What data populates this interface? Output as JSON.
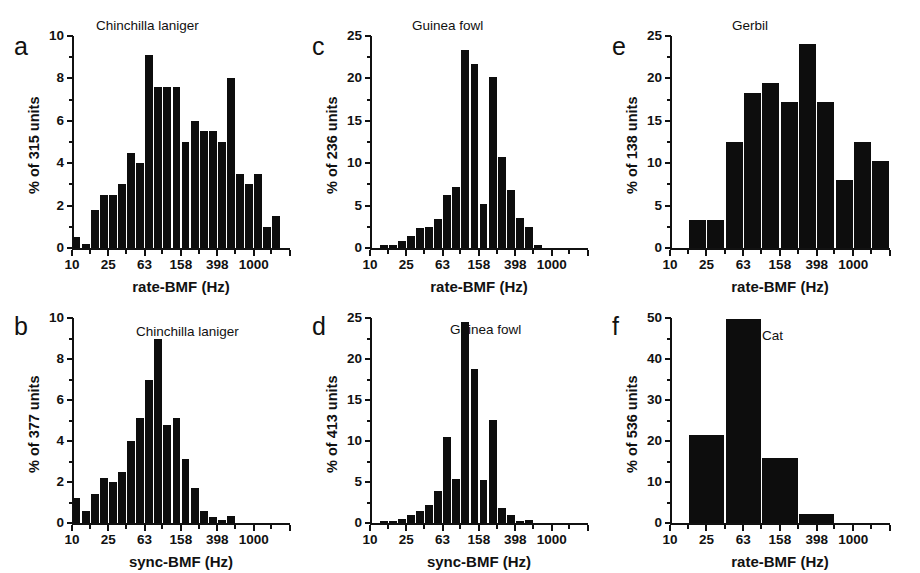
{
  "figure": {
    "background": "#ffffff",
    "bar_color": "#0d0d0d",
    "axis_color": "#111111"
  },
  "chart_data": [
    {
      "panel": "a",
      "type": "bar",
      "title": "Chinchilla laniger",
      "xlabel": "rate-BMF (Hz)",
      "ylabel": "% of 315 units",
      "n_units": 315,
      "ylim": [
        0,
        10
      ],
      "yticks": [
        0,
        2,
        4,
        6,
        8,
        10
      ],
      "ytick_labels": [
        "0",
        "2",
        "4",
        "6",
        "8",
        "10"
      ],
      "xscale": "log",
      "xlim": [
        10,
        2512
      ],
      "xticks": [
        10,
        25,
        63,
        158,
        398,
        1000
      ],
      "xtick_labels": [
        "10",
        "25",
        "63",
        "158",
        "398",
        "1000"
      ],
      "grid": false,
      "bin_decades": 0.1,
      "bin_starts": [
        10.0,
        12.59,
        15.85,
        19.95,
        25.12,
        31.62,
        39.81,
        50.12,
        63.1,
        79.43,
        100.0,
        125.9,
        158.5,
        199.5,
        251.2,
        316.2,
        398.1,
        501.2,
        631.0,
        794.3,
        1000.0,
        1259.0,
        1585.0,
        1995.0
      ],
      "values": [
        0.5,
        0.2,
        1.8,
        2.5,
        2.5,
        3.0,
        4.5,
        4.0,
        9.1,
        7.6,
        7.6,
        7.6,
        5.0,
        6.0,
        5.5,
        5.5,
        5.0,
        8.0,
        3.5,
        3.0,
        3.5,
        1.0,
        1.5,
        0.0
      ]
    },
    {
      "panel": "b",
      "type": "bar",
      "title": "Chinchilla laniger",
      "xlabel": "sync-BMF (Hz)",
      "ylabel": "% of 377 units",
      "n_units": 377,
      "ylim": [
        0,
        10
      ],
      "yticks": [
        0,
        2,
        4,
        6,
        8,
        10
      ],
      "ytick_labels": [
        "0",
        "2",
        "4",
        "6",
        "8",
        "10"
      ],
      "xscale": "log",
      "xlim": [
        10,
        2512
      ],
      "xticks": [
        10,
        25,
        63,
        158,
        398,
        1000
      ],
      "xtick_labels": [
        "10",
        "25",
        "63",
        "158",
        "398",
        "1000"
      ],
      "grid": false,
      "bin_decades": 0.1,
      "bin_starts": [
        10.0,
        12.59,
        15.85,
        19.95,
        25.12,
        31.62,
        39.81,
        50.12,
        63.1,
        79.43,
        100.0,
        125.9,
        158.5,
        199.5,
        251.2,
        316.2,
        398.1,
        501.2,
        631.0,
        794.3,
        1000.0,
        1259.0,
        1585.0,
        1995.0
      ],
      "values": [
        1.2,
        0.6,
        1.4,
        2.2,
        2.0,
        2.5,
        4.0,
        5.1,
        7.0,
        9.0,
        4.8,
        5.1,
        3.1,
        1.7,
        0.6,
        0.3,
        0.15,
        0.35,
        0.0,
        0.0,
        0.0,
        0.0,
        0.0,
        0.0
      ]
    },
    {
      "panel": "c",
      "type": "bar",
      "title": "Guinea fowl",
      "xlabel": "rate-BMF (Hz)",
      "ylabel": "% of 236 units",
      "n_units": 236,
      "ylim": [
        0,
        25
      ],
      "yticks": [
        0,
        5,
        10,
        15,
        20,
        25
      ],
      "ytick_labels": [
        "0",
        "5",
        "10",
        "15",
        "20",
        "25"
      ],
      "xscale": "log",
      "xlim": [
        10,
        2512
      ],
      "xticks": [
        10,
        25,
        63,
        158,
        398,
        1000
      ],
      "xtick_labels": [
        "10",
        "25",
        "63",
        "158",
        "398",
        "1000"
      ],
      "grid": false,
      "bin_decades": 0.1,
      "bin_starts": [
        10.0,
        12.59,
        15.85,
        19.95,
        25.12,
        31.62,
        39.81,
        50.12,
        63.1,
        79.43,
        100.0,
        125.9,
        158.5,
        199.5,
        251.2,
        316.2,
        398.1,
        501.2,
        631.0,
        794.3,
        1000.0,
        1259.0,
        1585.0,
        1995.0
      ],
      "values": [
        0.0,
        0.3,
        0.3,
        0.8,
        1.4,
        2.4,
        2.5,
        3.4,
        6.2,
        7.2,
        23.4,
        21.7,
        5.2,
        20.2,
        10.7,
        6.8,
        3.5,
        2.5,
        0.4,
        0.0,
        0.0,
        0.0,
        0.0,
        0.0
      ]
    },
    {
      "panel": "d",
      "type": "bar",
      "title": "Guinea fowl",
      "xlabel": "sync-BMF (Hz)",
      "ylabel": "% of 413 units",
      "n_units": 413,
      "ylim": [
        0,
        25
      ],
      "yticks": [
        0,
        5,
        10,
        15,
        20,
        25
      ],
      "ytick_labels": [
        "0",
        "5",
        "10",
        "15",
        "20",
        "25"
      ],
      "xscale": "log",
      "xlim": [
        10,
        2512
      ],
      "xticks": [
        10,
        25,
        63,
        158,
        398,
        1000
      ],
      "xtick_labels": [
        "10",
        "25",
        "63",
        "158",
        "398",
        "1000"
      ],
      "grid": false,
      "bin_decades": 0.1,
      "bin_starts": [
        10.0,
        12.59,
        15.85,
        19.95,
        25.12,
        31.62,
        39.81,
        50.12,
        63.1,
        79.43,
        100.0,
        125.9,
        158.5,
        199.5,
        251.2,
        316.2,
        398.1,
        501.2,
        631.0,
        794.3,
        1000.0,
        1259.0,
        1585.0,
        1995.0
      ],
      "values": [
        0.0,
        0.3,
        0.3,
        0.5,
        1.0,
        1.5,
        2.2,
        3.9,
        10.5,
        5.4,
        24.5,
        18.8,
        5.2,
        12.6,
        1.8,
        1.0,
        0.2,
        0.4,
        0.0,
        0.0,
        0.0,
        0.0,
        0.0,
        0.0
      ]
    },
    {
      "panel": "e",
      "type": "bar",
      "title": "Gerbil",
      "xlabel": "rate-BMF (Hz)",
      "ylabel": "% of 138 units",
      "n_units": 138,
      "ylim": [
        0,
        25
      ],
      "yticks": [
        0,
        5,
        10,
        15,
        20,
        25
      ],
      "ytick_labels": [
        "0",
        "5",
        "10",
        "15",
        "20",
        "25"
      ],
      "xscale": "log",
      "xlim": [
        10,
        2512
      ],
      "xticks": [
        10,
        25,
        63,
        158,
        398,
        1000
      ],
      "xtick_labels": [
        "10",
        "25",
        "63",
        "158",
        "398",
        "1000"
      ],
      "grid": false,
      "bin_decades": 0.2,
      "bin_starts": [
        10.0,
        15.85,
        25.12,
        39.81,
        63.1,
        100.0,
        158.5,
        251.2,
        398.1,
        631.0,
        1000.0,
        1585.0
      ],
      "values": [
        0.0,
        3.3,
        3.3,
        12.5,
        18.3,
        19.4,
        17.2,
        24.1,
        17.2,
        8.0,
        12.5,
        10.3
      ]
    },
    {
      "panel": "f",
      "type": "bar",
      "title": "Cat",
      "xlabel": "rate-BMF (Hz)",
      "ylabel": "% of 536 units",
      "n_units": 536,
      "ylim": [
        0,
        50
      ],
      "yticks": [
        0,
        10,
        20,
        30,
        40,
        50
      ],
      "ytick_labels": [
        "0",
        "10",
        "20",
        "30",
        "40",
        "50"
      ],
      "xscale": "log",
      "xlim": [
        10,
        2512
      ],
      "xticks": [
        10,
        25,
        63,
        158,
        398,
        1000
      ],
      "xtick_labels": [
        "10",
        "25",
        "63",
        "158",
        "398",
        "1000"
      ],
      "grid": false,
      "bin_decades": 0.4,
      "bin_starts": [
        10.0,
        15.85,
        39.81,
        100.0,
        251.2,
        631.0
      ],
      "values": [
        0.0,
        21.5,
        49.7,
        15.8,
        2.3,
        0.0
      ]
    }
  ]
}
